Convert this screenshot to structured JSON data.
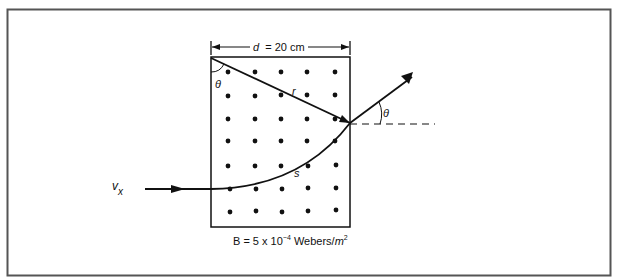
{
  "figure": {
    "width_label_var": "d",
    "width_label_value": "= 20 cm",
    "field_label_prefix": "B = 5 x 10",
    "field_label_exponent": "−4",
    "field_label_unit": " Webers/",
    "field_label_unit_var": "m",
    "field_label_unit_exp": "2",
    "angle_label_entry": "θ",
    "angle_label_exit": "θ",
    "chord_label": "r",
    "arc_label": "s",
    "velocity_label": "v",
    "velocity_subscript": "x",
    "dot_grid": {
      "columns": 5,
      "rows": 7,
      "meaning": "magnetic field out of page"
    }
  }
}
